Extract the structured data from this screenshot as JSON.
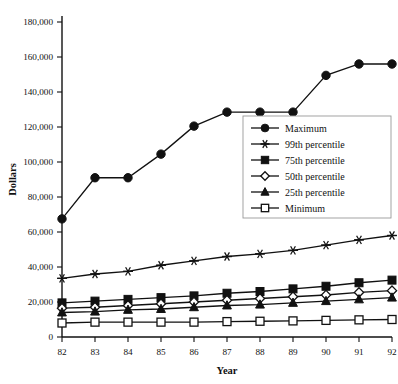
{
  "chart_data": {
    "type": "line",
    "title": "",
    "xlabel": "Year",
    "ylabel": "Dollars",
    "grid": false,
    "legend_position": "upper-right-inside",
    "categories": [
      "82",
      "83",
      "84",
      "85",
      "86",
      "87",
      "88",
      "89",
      "90",
      "91",
      "92"
    ],
    "x": [
      82,
      83,
      84,
      85,
      86,
      87,
      88,
      89,
      90,
      91,
      92
    ],
    "xlim": [
      82,
      92
    ],
    "ylim": [
      0,
      180000
    ],
    "ytick_labels": [
      "0",
      "20,000",
      "40,000",
      "60,000",
      "80,000",
      "100,000",
      "120,000",
      "140,000",
      "160,000",
      "180,000"
    ],
    "ytick_values": [
      0,
      20000,
      40000,
      60000,
      80000,
      100000,
      120000,
      140000,
      160000,
      180000
    ],
    "series": [
      {
        "name": "Maximum",
        "marker": "filled-circle",
        "values": [
          67500,
          91000,
          91000,
          104500,
          120500,
          128500,
          128500,
          128500,
          149500,
          156000,
          156000
        ]
      },
      {
        "name": "99th percentile",
        "marker": "asterisk",
        "values": [
          33500,
          36000,
          37500,
          41000,
          43500,
          46000,
          47500,
          49500,
          52500,
          55500,
          58000
        ]
      },
      {
        "name": "75th percentile",
        "marker": "filled-square",
        "values": [
          19500,
          20500,
          21500,
          22500,
          23500,
          25000,
          26000,
          27500,
          29000,
          31000,
          32500
        ]
      },
      {
        "name": "50th percentile",
        "marker": "open-diamond",
        "values": [
          16500,
          17000,
          18000,
          19000,
          20000,
          21000,
          22000,
          23000,
          24000,
          25500,
          26500
        ]
      },
      {
        "name": "25th percentile",
        "marker": "filled-triangle",
        "values": [
          14000,
          14500,
          15500,
          16000,
          17000,
          18000,
          18500,
          19500,
          20500,
          21500,
          22500
        ]
      },
      {
        "name": "Minimum",
        "marker": "open-square",
        "values": [
          8000,
          8500,
          8500,
          8500,
          8500,
          8800,
          9000,
          9200,
          9500,
          9800,
          10000
        ]
      }
    ]
  }
}
